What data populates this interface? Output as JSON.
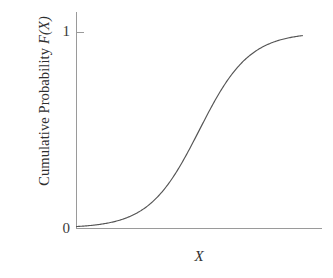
{
  "chart_data": {
    "type": "line",
    "title": "",
    "subtitle": "",
    "xlabel": "X",
    "ylabel": "Cumulative Probability",
    "ylabel_variable": "F(X)",
    "ylabel_full": "Cumulative Probability F(X)",
    "yticks": [
      "0",
      "1"
    ],
    "ytick_values": [
      0,
      1
    ],
    "xticks": [],
    "xlim": [
      0,
      10
    ],
    "ylim": [
      0,
      1
    ],
    "grid": false,
    "legend": null,
    "annotations": [],
    "series": [
      {
        "name": "Cumulative distribution function",
        "shape": "logistic-sigmoid",
        "color": "#555555",
        "line_width": 1.15,
        "x": [
          0.0,
          0.4,
          0.8,
          1.2,
          1.6,
          2.0,
          2.4,
          2.8,
          3.2,
          3.6,
          4.0,
          4.4,
          4.8,
          5.2,
          5.6,
          6.0,
          6.4,
          6.8,
          7.2,
          7.6,
          8.0,
          8.4,
          8.8,
          9.2
        ],
        "y": [
          0.004,
          0.006,
          0.009,
          0.014,
          0.021,
          0.032,
          0.049,
          0.074,
          0.111,
          0.163,
          0.235,
          0.329,
          0.442,
          0.564,
          0.679,
          0.777,
          0.851,
          0.903,
          0.938,
          0.961,
          0.976,
          0.985,
          0.991,
          0.995
        ]
      }
    ]
  },
  "figure": {
    "background_color": "#ffffff",
    "axis_color": "#9a9a9a",
    "curve_color": "#555555",
    "text_color": "#2e2e2e"
  }
}
